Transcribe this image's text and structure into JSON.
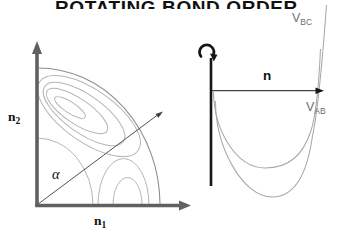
{
  "title": {
    "text": "ROTATING BOND ORDER"
  },
  "colors": {
    "background": "#ffffff",
    "ink": "#161616",
    "axis_gray": "#606060",
    "diagonal_gray": "#3f3f3f",
    "contour_light": "#b5b5b5",
    "contour_dark": "#8e8e8e",
    "curve_gray": "#a8a8a8",
    "curve_label_gray": "#6f6f6f"
  },
  "left_plot": {
    "y_axis_label": {
      "base": "n",
      "sub": "2"
    },
    "x_axis_label": {
      "base": "n",
      "sub": "1"
    },
    "angle_label": "α"
  },
  "right_plot": {
    "axis_label": "n",
    "rotation_icon": "↺",
    "curve_bc_label": {
      "base": "V",
      "sub": "BC"
    },
    "curve_ab_label": {
      "base": "V",
      "sub": "AB"
    }
  }
}
